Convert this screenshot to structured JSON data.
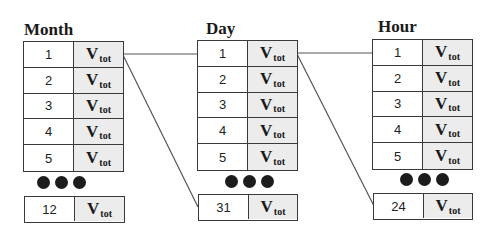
{
  "tables": [
    {
      "title": "Month",
      "rows": [
        {
          "num": "1",
          "label": "V",
          "sub": "tot"
        },
        {
          "num": "2",
          "label": "V",
          "sub": "tot"
        },
        {
          "num": "3",
          "label": "V",
          "sub": "tot"
        },
        {
          "num": "4",
          "label": "V",
          "sub": "tot"
        },
        {
          "num": "5",
          "label": "V",
          "sub": "tot"
        }
      ],
      "last": {
        "num": "12",
        "label": "V",
        "sub": "tot"
      }
    },
    {
      "title": "Day",
      "rows": [
        {
          "num": "1",
          "label": "V",
          "sub": "tot"
        },
        {
          "num": "2",
          "label": "V",
          "sub": "tot"
        },
        {
          "num": "3",
          "label": "V",
          "sub": "tot"
        },
        {
          "num": "4",
          "label": "V",
          "sub": "tot"
        },
        {
          "num": "5",
          "label": "V",
          "sub": "tot"
        }
      ],
      "last": {
        "num": "31",
        "label": "V",
        "sub": "tot"
      }
    },
    {
      "title": "Hour",
      "rows": [
        {
          "num": "1",
          "label": "V",
          "sub": "tot"
        },
        {
          "num": "2",
          "label": "V",
          "sub": "tot"
        },
        {
          "num": "3",
          "label": "V",
          "sub": "tot"
        },
        {
          "num": "4",
          "label": "V",
          "sub": "tot"
        },
        {
          "num": "5",
          "label": "V",
          "sub": "tot"
        }
      ],
      "last": {
        "num": "24",
        "label": "V",
        "sub": "tot"
      }
    }
  ],
  "colors": {
    "border": "#3a3a3a",
    "value_cell_bg": "#ececec",
    "dot": "#1c1c1c"
  }
}
